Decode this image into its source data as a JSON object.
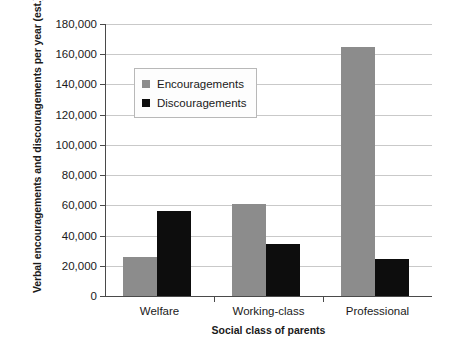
{
  "chart_data": {
    "type": "bar",
    "title": "",
    "xlabel": "Social class of parents",
    "ylabel": "Verbal encouragements and discouragements per year (est.)",
    "categories": [
      "Welfare",
      "Working-class",
      "Professional"
    ],
    "series": [
      {
        "name": "Encouragements",
        "color": "#8c8c8c",
        "values": [
          26000,
          61000,
          165000
        ]
      },
      {
        "name": "Discouragements",
        "color": "#0d0d0d",
        "values": [
          56000,
          34500,
          24500
        ]
      }
    ],
    "ylim": [
      0,
      180000
    ],
    "ytick_step": 20000,
    "ytick_labels": [
      "0",
      "20,000",
      "40,000",
      "60,000",
      "80,000",
      "100,000",
      "120,000",
      "140,000",
      "160,000",
      "180,000"
    ],
    "ytick_values": [
      0,
      20000,
      40000,
      60000,
      80000,
      100000,
      120000,
      140000,
      160000,
      180000
    ],
    "grid": true,
    "legend_position": "upper-left-inside"
  }
}
